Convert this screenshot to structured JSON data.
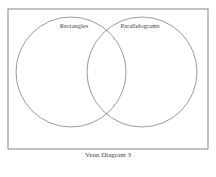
{
  "diagram": {
    "type": "venn",
    "sets": [
      {
        "label": "Rectangles"
      },
      {
        "label": "Parallelograms"
      }
    ],
    "caption": "Venn Diagram 3",
    "stroke_color": "#555555",
    "frame_color": "#666666"
  }
}
